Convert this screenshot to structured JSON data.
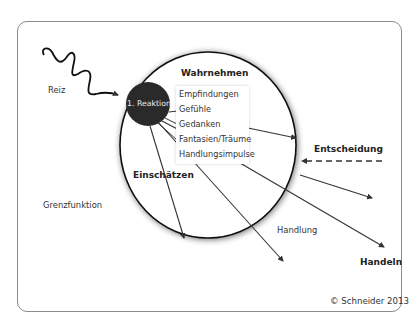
{
  "diagram": {
    "stimulus_label": "Reiz",
    "first_reaction_label": "1. Reaktion",
    "perception_heading": "Wahrnehmen",
    "perception_items": [
      "Empfindungen",
      "Gefühle",
      "Gedanken",
      "Fantasien/Träume",
      "Handlungsimpulse"
    ],
    "assessment_label": "Einschätzen",
    "decision_label": "Entscheidung",
    "boundary_label": "Grenzfunktion",
    "action_label": "Handlung",
    "acting_label": "Handeln",
    "copyright": "© Schneider 2013"
  },
  "colors": {
    "frame_border": "#8a8a8a",
    "circle_stroke": "#111111",
    "reaction_fill": "#2a2a2a",
    "arrow": "#333333",
    "text": "#333333"
  }
}
